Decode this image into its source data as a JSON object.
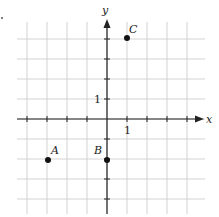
{
  "figure": {
    "type": "coordinate-plane",
    "axes": {
      "x_label": "x",
      "y_label": "y",
      "x_tick_label": "1",
      "y_tick_label": "1",
      "x_range": [
        -4,
        4
      ],
      "y_range": [
        -4,
        4
      ],
      "unit_px": 20,
      "origin_px": [
        107,
        119
      ]
    },
    "grid": {
      "on": true,
      "color": "#c8c8c8",
      "step": 1
    },
    "points": [
      {
        "name": "A",
        "x": -3,
        "y": -2
      },
      {
        "name": "B",
        "x": 0,
        "y": -2
      },
      {
        "name": "C",
        "x": 1,
        "y": 4
      }
    ],
    "colors": {
      "axis": "#222222",
      "point": "#111111",
      "grid": "#c8c8c8"
    }
  }
}
